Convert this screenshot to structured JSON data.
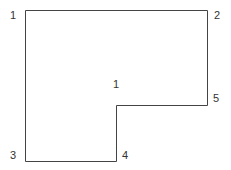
{
  "diagram": {
    "shape_label": "1",
    "vertices": [
      {
        "id": "1",
        "label": "1"
      },
      {
        "id": "2",
        "label": "2"
      },
      {
        "id": "5",
        "label": "5"
      },
      {
        "id": "4",
        "label": "4"
      },
      {
        "id": "3",
        "label": "3"
      }
    ],
    "stroke_color": "#444444"
  }
}
